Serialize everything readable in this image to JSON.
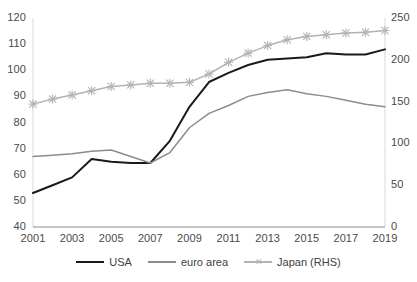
{
  "chart_data": {
    "type": "line",
    "title": "",
    "xlabel": "",
    "ylabel": "",
    "grid": false,
    "legend_position": "bottom",
    "x": [
      2001,
      2002,
      2003,
      2004,
      2005,
      2006,
      2007,
      2008,
      2009,
      2010,
      2011,
      2012,
      2013,
      2014,
      2015,
      2016,
      2017,
      2018,
      2019
    ],
    "xticks": [
      "2001",
      "2003",
      "2005",
      "2007",
      "2009",
      "2011",
      "2013",
      "2015",
      "2017",
      "2019"
    ],
    "left_axis": {
      "ticks": [
        "40",
        "50",
        "60",
        "70",
        "80",
        "90",
        "100",
        "110",
        "120"
      ],
      "min": 40,
      "max": 120
    },
    "right_axis": {
      "ticks": [
        "0",
        "50",
        "100",
        "150",
        "200",
        "250"
      ],
      "min": 0,
      "max": 250
    },
    "series": [
      {
        "name": "USA",
        "axis": "left",
        "color": "#1a1a1a",
        "marker": "none",
        "values": [
          53,
          56,
          59,
          66,
          65,
          64.5,
          64.5,
          73,
          86,
          95.5,
          99,
          102,
          104,
          104.5,
          105,
          106.5,
          106,
          106,
          108
        ]
      },
      {
        "name": "euro area",
        "axis": "left",
        "color": "#8c8c8c",
        "marker": "none",
        "values": [
          67,
          67.5,
          68,
          69,
          69.5,
          67,
          64.5,
          68.5,
          78,
          83.5,
          86.5,
          90,
          91.5,
          92.5,
          91,
          90,
          88.5,
          87,
          86
        ]
      },
      {
        "name": "Japan (RHS)",
        "axis": "right",
        "color": "#b3b3b3",
        "marker": "x",
        "values": [
          147,
          153,
          158,
          163,
          168,
          170,
          172,
          172,
          173,
          183,
          197,
          208,
          217,
          224,
          228,
          230,
          232,
          233,
          235
        ]
      }
    ]
  }
}
